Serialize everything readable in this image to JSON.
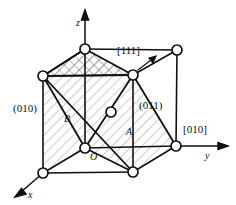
{
  "figure": {
    "kind": "crystal-unit-cell-diagram",
    "background": "#ffffff",
    "line_color": "#111111",
    "hatch_color": "#9a9a9a",
    "atom_fill": "#ffffff"
  },
  "axes": [
    {
      "id": "z",
      "label": "z",
      "direction": "up"
    },
    {
      "id": "y",
      "label": "y",
      "direction": "right"
    },
    {
      "id": "x",
      "label": "x",
      "direction": "down-left"
    }
  ],
  "origin": {
    "label": "O"
  },
  "plane_labels": [
    {
      "id": "plane-010",
      "label": "(010)"
    },
    {
      "id": "plane-011",
      "label": "(011)"
    }
  ],
  "region_labels": [
    {
      "id": "region-a",
      "label": "A"
    },
    {
      "id": "region-b",
      "label": "B"
    }
  ],
  "direction_labels": [
    {
      "id": "dir-111",
      "label": "[111]"
    },
    {
      "id": "dir-010",
      "label": "[010]"
    }
  ],
  "atoms": {
    "corner_count": 8,
    "center_count": 1,
    "radius_px": 5
  }
}
